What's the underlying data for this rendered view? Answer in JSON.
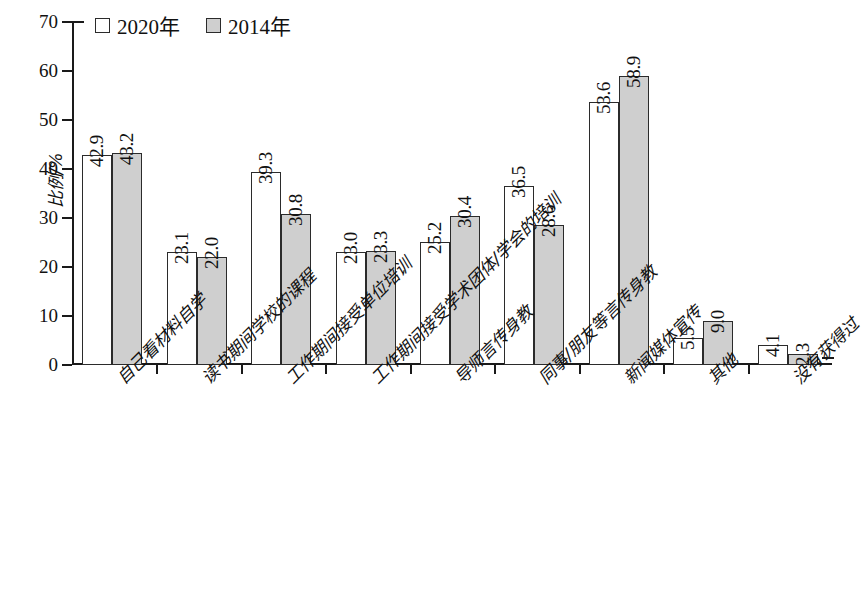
{
  "chart_data": {
    "type": "bar",
    "title": "",
    "xlabel": "",
    "ylabel": "比例/%",
    "ylim": [
      0,
      70
    ],
    "yticks": [
      0,
      10,
      20,
      30,
      40,
      50,
      60,
      70
    ],
    "grid": false,
    "legend_position": "top-left",
    "categories": [
      "自己看材料自学",
      "读书期间学校的课程",
      "工作期间接受单位培训",
      "工作期间接受学术团体/学会的培训",
      "导师言传身教",
      "同事/朋友等言传身教",
      "新闻媒体宣传",
      "其他",
      "没有获得过"
    ],
    "series": [
      {
        "name": "2020年",
        "color": "#ffffff",
        "values": [
          42.9,
          23.1,
          39.3,
          23.0,
          25.2,
          36.5,
          53.6,
          5.5,
          4.1
        ]
      },
      {
        "name": "2014年",
        "color": "#cfcfcf",
        "values": [
          43.2,
          22.0,
          30.8,
          23.3,
          30.4,
          28.6,
          58.9,
          9.0,
          2.3
        ]
      }
    ]
  },
  "legend": {
    "items": [
      {
        "label": "2020年",
        "swatch": "white"
      },
      {
        "label": "2014年",
        "swatch": "gray"
      }
    ]
  },
  "axis": {
    "y_title": "比例/%",
    "y_tick_labels": [
      "70",
      "60",
      "50",
      "40",
      "30",
      "20",
      "10",
      "0"
    ]
  }
}
